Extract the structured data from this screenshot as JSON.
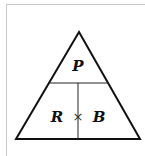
{
  "diagram": {
    "type": "formula-triangle",
    "top_label": "P",
    "bottom_left_label": "R",
    "bottom_operator": "×",
    "bottom_right_label": "B",
    "colors": {
      "stroke": "#111111",
      "frame": "#c8c8c8",
      "background": "#ffffff"
    }
  }
}
